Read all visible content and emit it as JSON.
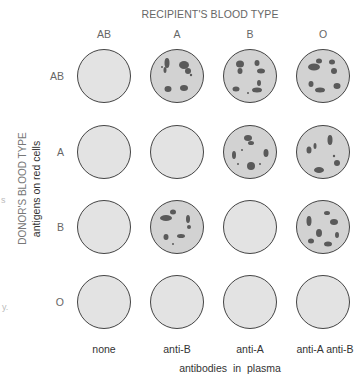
{
  "header": {
    "title": "RECIPIENT'S BLOOD TYPE",
    "columns": [
      "AB",
      "A",
      "B",
      "O"
    ]
  },
  "side": {
    "title": "DONOR'S BLOOD TYPE",
    "subtitle": "antigens on red cells",
    "rows": [
      "AB",
      "A",
      "B",
      "O"
    ]
  },
  "footer": {
    "antibodies": [
      "none",
      "anti-B",
      "anti-A",
      "anti-A anti-B"
    ],
    "title": "antibodies in plasma"
  },
  "colors": {
    "well_empty": "#e3e3e3",
    "well_agglutinated": "#d2d2d2",
    "clump": "#5a5a5a",
    "outline": "#444444"
  },
  "grid": {
    "description": "Agglutination results: rows = donor type, columns = recipient type",
    "cells": [
      [
        "clear",
        "agglutinated",
        "agglutinated",
        "agglutinated"
      ],
      [
        "clear",
        "clear",
        "agglutinated",
        "agglutinated"
      ],
      [
        "clear",
        "agglutinated",
        "clear",
        "agglutinated"
      ],
      [
        "clear",
        "clear",
        "clear",
        "clear"
      ]
    ]
  }
}
